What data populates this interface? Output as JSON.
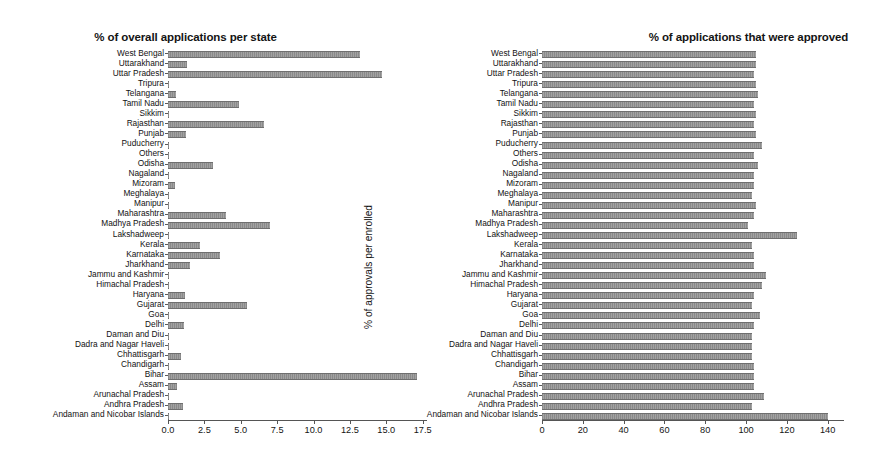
{
  "chart_data": [
    {
      "type": "bar",
      "orientation": "horizontal",
      "title": "% of overall applications per state",
      "xlabel": "",
      "ylabel": "",
      "xlim": [
        0,
        17.8
      ],
      "xticks": [
        "0.0",
        "2.5",
        "5.0",
        "7.5",
        "10.0",
        "12.5",
        "15.0",
        "17.5"
      ],
      "xtickvalues": [
        0,
        2.5,
        5.0,
        7.5,
        10.0,
        12.5,
        15.0,
        17.5
      ],
      "grid": false,
      "legend": null,
      "categories": [
        "West Bengal",
        "Uttarakhand",
        "Uttar Pradesh",
        "Tripura",
        "Telangana",
        "Tamil Nadu",
        "Sikkim",
        "Rajasthan",
        "Punjab",
        "Puducherry",
        "Others",
        "Odisha",
        "Nagaland",
        "Mizoram",
        "Meghalaya",
        "Manipur",
        "Maharashtra",
        "Madhya Pradesh",
        "Lakshadweep",
        "Kerala",
        "Karnataka",
        "Jharkhand",
        "Jammu and Kashmir",
        "Himachal Pradesh",
        "Haryana",
        "Gujarat",
        "Goa",
        "Delhi",
        "Daman and Diu",
        "Dadra and Nagar Haveli",
        "Chhattisgarh",
        "Chandigarh",
        "Bihar",
        "Assam",
        "Arunachal Pradesh",
        "Andhra Pradesh",
        "Andaman and Nicobar Islands"
      ],
      "values": [
        13.2,
        1.3,
        14.7,
        0.05,
        0.55,
        4.9,
        0.01,
        6.6,
        1.25,
        0.01,
        0.02,
        3.1,
        0.05,
        0.45,
        0.03,
        0.06,
        4.0,
        7.0,
        0.01,
        2.2,
        3.6,
        1.5,
        0.08,
        0.07,
        1.2,
        5.4,
        0.06,
        1.1,
        0.01,
        0.01,
        0.9,
        0.02,
        17.1,
        0.6,
        0.06,
        1.0,
        0.01
      ]
    },
    {
      "type": "bar",
      "orientation": "horizontal",
      "title": "% of applications that were approved",
      "xlabel": "",
      "ylabel": "",
      "xlim": [
        0,
        148
      ],
      "xticks": [
        "0",
        "20",
        "40",
        "60",
        "80",
        "100",
        "120",
        "140"
      ],
      "xtickvalues": [
        0,
        20,
        40,
        60,
        80,
        100,
        120,
        140
      ],
      "grid": false,
      "legend": null,
      "categories": [
        "West Bengal",
        "Uttarakhand",
        "Uttar Pradesh",
        "Tripura",
        "Telangana",
        "Tamil Nadu",
        "Sikkim",
        "Rajasthan",
        "Punjab",
        "Puducherry",
        "Others",
        "Odisha",
        "Nagaland",
        "Mizoram",
        "Meghalaya",
        "Manipur",
        "Maharashtra",
        "Madhya Pradesh",
        "Lakshadweep",
        "Kerala",
        "Karnataka",
        "Jharkhand",
        "Jammu and Kashmir",
        "Himachal Pradesh",
        "Haryana",
        "Gujarat",
        "Goa",
        "Delhi",
        "Daman and Diu",
        "Dadra and Nagar Haveli",
        "Chhattisgarh",
        "Chandigarh",
        "Bihar",
        "Assam",
        "Arunachal Pradesh",
        "Andhra Pradesh",
        "Andaman and Nicobar Islands"
      ],
      "values": [
        105,
        105,
        104,
        105,
        106,
        104,
        105,
        104,
        105,
        108,
        104,
        106,
        104,
        104,
        103,
        105,
        104,
        101,
        125,
        103,
        104,
        104,
        110,
        108,
        104,
        103,
        107,
        104,
        103,
        103,
        103,
        104,
        104,
        104,
        109,
        103,
        140
      ]
    }
  ],
  "rotated_label": "% of approvals per enrolled",
  "colors": {
    "bar": "#8e8e8e",
    "bar_edge": "#6f6f6f",
    "axis": "#555555",
    "text": "#141414",
    "background": "#ffffff"
  }
}
